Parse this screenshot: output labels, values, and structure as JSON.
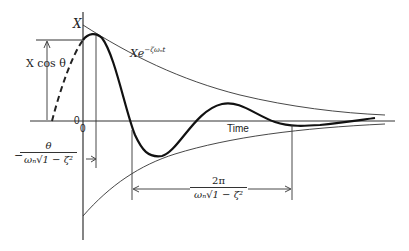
{
  "diagram": {
    "type": "damped-oscillation-response",
    "labels": {
      "y_axis": "X",
      "amplitude_marker": "X cos θ",
      "envelope": "Xe",
      "envelope_exp": "−ζωₙt",
      "origin_left": "0",
      "origin_below": "0",
      "time_axis": "Time",
      "phase_num": "θ",
      "phase_den": "ωₙ√1 − ζ²",
      "phase_sign": "−",
      "period_num": "2π",
      "period_den": "ωₙ√1 − ζ²"
    },
    "colors": {
      "ink": "#222222",
      "background": "#ffffff"
    }
  }
}
